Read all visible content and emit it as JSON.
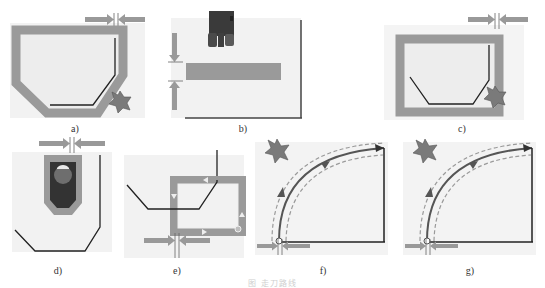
{
  "figure": {
    "caption": "图 走刀路线",
    "colors": {
      "background_panel": "#ededed",
      "stock_gray": "#9a9a9a",
      "path_black": "#222222",
      "arrow_gray": "#999999",
      "cutter_gray": "#7a7a7a",
      "tool_dark": "#3a3a3a",
      "dashed": "#9a9a9a"
    },
    "panels": [
      {
        "id": "a",
        "label": "a)",
        "description": "Pocket contour with offset stock band and star cutter at lower right; width indicator arrows top right"
      },
      {
        "id": "b",
        "label": "b)",
        "description": "Horizontal slot bar with dark tool holder above; vertical width indicator arrows at left"
      },
      {
        "id": "c",
        "label": "c)",
        "description": "Rectangular stock frame with inner contour path and star cutter; width indicator arrows top right"
      },
      {
        "id": "d",
        "label": "d)",
        "description": "Tool viewed from above inside gray slot, contour path below; width indicator arrows on top"
      },
      {
        "id": "e",
        "label": "e)",
        "description": "Square loop toolpath with arrows around contour; width indicator arrows at bottom"
      },
      {
        "id": "f",
        "label": "f)",
        "description": "Quarter-arc toolpath with dashed offset curves, star cutter top left; entry circle and width arrows bottom left"
      },
      {
        "id": "g",
        "label": "g)",
        "description": "Quarter-arc toolpath with dashed offset curves, star cutter top left; entry circle and width arrows bottom left"
      }
    ]
  }
}
